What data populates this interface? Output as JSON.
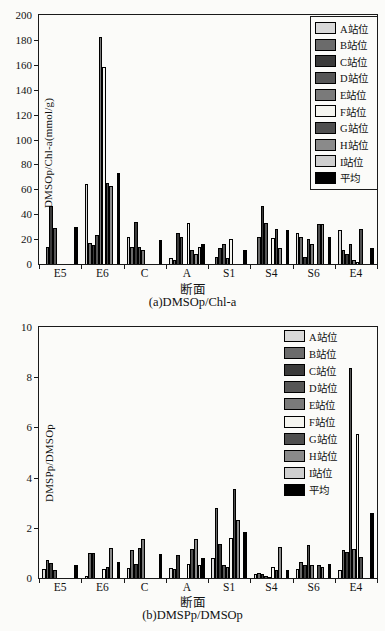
{
  "figure": {
    "xlabel": "断面",
    "caption_a": "(a)DMSOp/Chl-a",
    "caption_b": "(b)DMSPp/DMSOp",
    "axis_color": "#1a1a1a",
    "background": "#fbfbf9"
  },
  "chart_data": [
    {
      "id": "a",
      "type": "bar",
      "caption": "(a)DMSOp/Chl-a",
      "ylabel": "DMSOp/Chl-a(mmol/g)",
      "xlabel": "断面",
      "ylim": [
        0,
        200
      ],
      "yticks": [
        0,
        20,
        40,
        60,
        80,
        100,
        120,
        140,
        160,
        180,
        200
      ],
      "grid": false,
      "legend_position": "top-right-inside-bordered",
      "categories": [
        "E5",
        "E6",
        "C",
        "A",
        "S1",
        "S4",
        "S6",
        "E4"
      ],
      "series": [
        {
          "name": "A站位",
          "color": "#d9d9d9",
          "values": [
            null,
            64,
            22,
            5,
            null,
            null,
            25,
            27
          ]
        },
        {
          "name": "B站位",
          "color": "#6b6b6b",
          "values": [
            14,
            17,
            14,
            3,
            6,
            22,
            22,
            11
          ]
        },
        {
          "name": "C站位",
          "color": "#3a3a3a",
          "values": [
            47,
            15,
            34,
            25,
            13,
            47,
            6,
            8
          ]
        },
        {
          "name": "D站位",
          "color": "#565656",
          "values": [
            29,
            23,
            14,
            22,
            16,
            33,
            20,
            16
          ]
        },
        {
          "name": "E站位",
          "color": "#7a7a7a",
          "values": [
            null,
            182,
            11,
            null,
            5,
            null,
            16,
            3
          ]
        },
        {
          "name": "F站位",
          "color": "#f5f5f0",
          "values": [
            null,
            158,
            null,
            33,
            20,
            21,
            null,
            2
          ]
        },
        {
          "name": "G站位",
          "color": "#4f4f4f",
          "values": [
            null,
            65,
            null,
            11,
            null,
            28,
            32,
            28
          ]
        },
        {
          "name": "H站位",
          "color": "#8a8a8a",
          "values": [
            null,
            63,
            null,
            8,
            null,
            13,
            32,
            null
          ]
        },
        {
          "name": "I站位",
          "color": "#cfcfcf",
          "values": [
            null,
            null,
            null,
            14,
            null,
            null,
            null,
            null
          ]
        },
        {
          "name": "平均",
          "color": "#000000",
          "values": [
            30,
            73,
            19,
            16,
            11,
            27,
            22,
            13
          ]
        }
      ]
    },
    {
      "id": "b",
      "type": "bar",
      "caption": "(b)DMSPp/DMSOp",
      "ylabel": "DMSPp/DMSOp",
      "xlabel": "断面",
      "ylim": [
        0,
        10
      ],
      "yticks": [
        0,
        2,
        4,
        6,
        8,
        10
      ],
      "grid": false,
      "legend_position": "top-right-inside-borderless",
      "categories": [
        "E5",
        "E6",
        "C",
        "A",
        "S1",
        "S4",
        "S6",
        "E4"
      ],
      "series": [
        {
          "name": "A站位",
          "color": "#d9d9d9",
          "values": [
            0.35,
            0.1,
            0.4,
            0.4,
            0.8,
            0.15,
            0.35,
            0.3
          ]
        },
        {
          "name": "B站位",
          "color": "#6b6b6b",
          "values": [
            0.7,
            1.0,
            1.1,
            0.35,
            2.8,
            0.2,
            0.65,
            1.1
          ]
        },
        {
          "name": "C站位",
          "color": "#3a3a3a",
          "values": [
            0.6,
            1.0,
            0.55,
            0.9,
            1.35,
            0.15,
            0.5,
            1.05
          ]
        },
        {
          "name": "D站位",
          "color": "#565656",
          "values": [
            0.3,
            null,
            1.2,
            null,
            0.5,
            0.1,
            1.3,
            8.35
          ]
        },
        {
          "name": "E站位",
          "color": "#7a7a7a",
          "values": [
            null,
            null,
            1.55,
            null,
            0.45,
            0.05,
            0.5,
            1.15
          ]
        },
        {
          "name": "F站位",
          "color": "#f5f5f0",
          "values": [
            null,
            0.35,
            null,
            0.55,
            1.6,
            0.45,
            null,
            5.75
          ]
        },
        {
          "name": "G站位",
          "color": "#4f4f4f",
          "values": [
            null,
            0.45,
            null,
            1.15,
            3.55,
            0.3,
            0.5,
            0.85
          ]
        },
        {
          "name": "H站位",
          "color": "#8a8a8a",
          "values": [
            null,
            1.2,
            null,
            1.55,
            2.3,
            1.25,
            0.45,
            null
          ]
        },
        {
          "name": "I站位",
          "color": "#cfcfcf",
          "values": [
            null,
            null,
            null,
            0.5,
            null,
            null,
            null,
            null
          ]
        },
        {
          "name": "平均",
          "color": "#000000",
          "values": [
            0.5,
            0.62,
            0.95,
            0.8,
            1.85,
            0.3,
            0.55,
            2.6
          ]
        }
      ]
    }
  ]
}
